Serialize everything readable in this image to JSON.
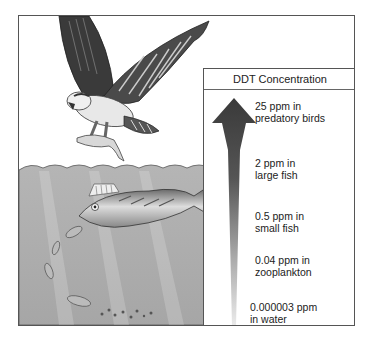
{
  "title": "DDT Concentration",
  "levels": [
    {
      "value": "25 ppm in",
      "organism": "predatory birds"
    },
    {
      "value": "2 ppm in",
      "organism": "large fish"
    },
    {
      "value": "0.5 ppm in",
      "organism": "small fish"
    },
    {
      "value": "0.04 ppm in",
      "organism": "zooplankton"
    },
    {
      "value": "0.000003 ppm",
      "organism": "in water"
    }
  ],
  "colors": {
    "arrow_dark": "#3a3a3a",
    "arrow_light": "#e6e6e6",
    "water": "#a9a9a9",
    "frame": "#555555"
  }
}
